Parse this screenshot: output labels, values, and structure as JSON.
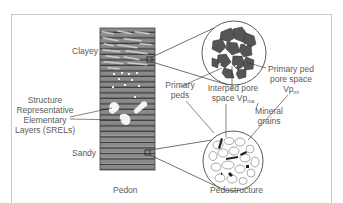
{
  "figure": {
    "type": "soil-structure-diagram",
    "colors": {
      "frame": "#c8c8c8",
      "pedon_fill": "#7a7a7a",
      "pedon_stripe": "#4a4a4a",
      "ped_fill": "#555555",
      "line": "#333333",
      "text": "#5a5a5a"
    }
  },
  "pedon": {
    "label": "Pedon",
    "top_layer_label": "Clayey",
    "bottom_layer_label": "Sandy",
    "srel_label_lines": [
      "Structure",
      "Representative",
      "Elementary",
      "Layers (SRELs)"
    ]
  },
  "primary_peds_circle": {
    "labels": {
      "primary_peds_line1": "Primary",
      "primary_peds_line2": "peds",
      "interped_line1": "Interped pore",
      "interped_line2": "space Vp",
      "interped_sub": "ma",
      "primary_pore_line1": "Primary ped",
      "primary_pore_line2": "pore space",
      "primary_pore_line3": "Vp",
      "primary_pore_sub": "mi"
    }
  },
  "pedostructure_circle": {
    "label": "Pedostructure",
    "mineral_line1": "Mineral",
    "mineral_line2": "grains"
  }
}
